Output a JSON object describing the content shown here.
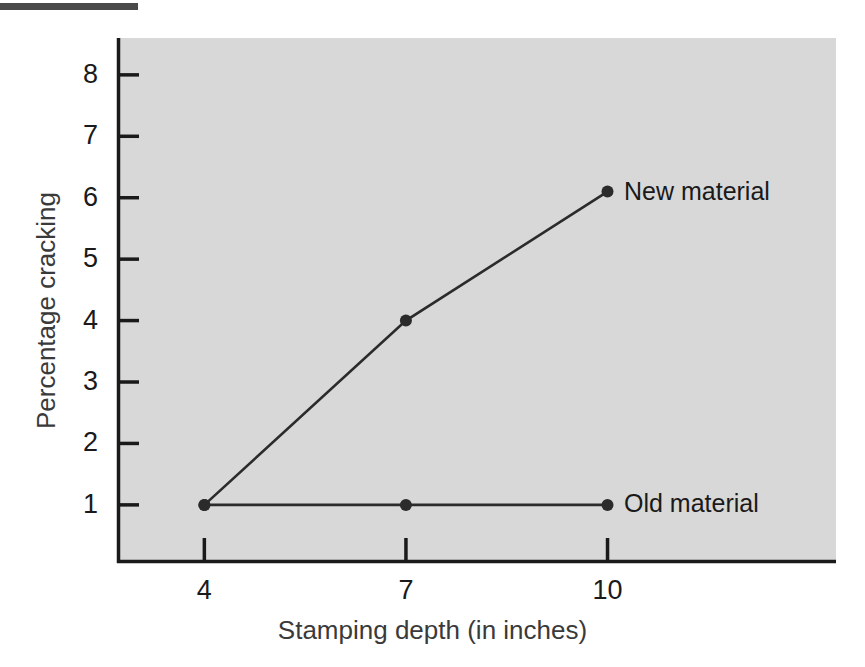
{
  "figure": {
    "rule": "top-rule",
    "background": "#ffffff",
    "plot_background": "#d8d8d8",
    "ink_color": "#1a1a1a"
  },
  "chart_data": {
    "type": "line",
    "title": "",
    "xlabel": "Stamping depth (in inches)",
    "ylabel": "Percentage cracking",
    "x": [
      4,
      7,
      10
    ],
    "xticks": [
      "4",
      "7",
      "10"
    ],
    "yticks": [
      "1",
      "2",
      "3",
      "4",
      "5",
      "6",
      "7",
      "8"
    ],
    "xlim": [
      2.7,
      13.4
    ],
    "ylim": [
      0.07,
      8.6
    ],
    "grid": false,
    "legend_position": "inline-right-of-last-point",
    "series": [
      {
        "name": "New material",
        "values": [
          1,
          4,
          6.1
        ],
        "marker": "filled-circle",
        "color": "#2b2b2b"
      },
      {
        "name": "Old material",
        "values": [
          1,
          1,
          1
        ],
        "marker": "filled-circle",
        "color": "#2b2b2b"
      }
    ],
    "annotations": [
      {
        "text": "New material",
        "x": 10,
        "y": 6.1
      },
      {
        "text": "Old material",
        "x": 10,
        "y": 1
      }
    ]
  }
}
